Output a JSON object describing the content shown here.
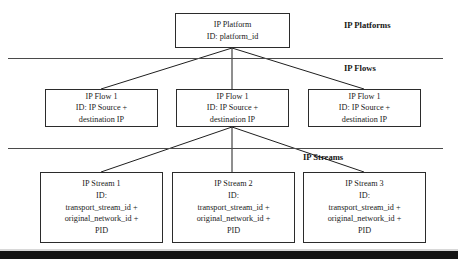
{
  "diagram": {
    "tiers": [
      {
        "label": "IP Platforms"
      },
      {
        "label": "IP Flows"
      },
      {
        "label": "IP Streams"
      }
    ],
    "platform": {
      "name": "IP Platform",
      "id_line": "ID: platform_id"
    },
    "flows": [
      {
        "name": "IP Flow 1",
        "id_line_1": "ID: IP Source +",
        "id_line_2": "destination IP"
      },
      {
        "name": "IP Flow 1",
        "id_line_1": "ID: IP Source +",
        "id_line_2": "destination IP"
      },
      {
        "name": "IP Flow 1",
        "id_line_1": "ID: IP Source +",
        "id_line_2": "destination IP"
      }
    ],
    "streams": [
      {
        "name": "IP Stream 1",
        "id_label": "ID:",
        "id_line_1": "transport_stream_id +",
        "id_line_2": "original_network_id +",
        "id_line_3": "PID"
      },
      {
        "name": "IP Stream 2",
        "id_label": "ID:",
        "id_line_1": "transport_stream_id +",
        "id_line_2": "original_network_id +",
        "id_line_3": "PID"
      },
      {
        "name": "IP Stream 3",
        "id_label": "ID:",
        "id_line_1": "transport_stream_id +",
        "id_line_2": "original_network_id +",
        "id_line_3": "PID"
      }
    ],
    "colors": {
      "box_border": "#2b2b2b",
      "divider": "#4a4a4a",
      "connector": "#1f1f1f",
      "text": "#1a1a1a",
      "bottom_band": "#141414"
    }
  }
}
